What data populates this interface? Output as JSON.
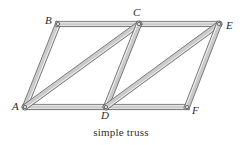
{
  "figure": {
    "caption": "simple truss",
    "background_color": "#ffffff",
    "label_color": "#2b2b2b",
    "member_fill_light": "#e9e9e9",
    "member_fill_mid": "#cfcfcf",
    "member_fill_dark": "#a9a9a9",
    "member_outline": "#58585a",
    "joint_pin_fill": "#d8d8d8",
    "joint_pin_stroke": "#4a4a4a",
    "member_width": 5.2
  },
  "truss": {
    "type": "planar-simple-truss",
    "joint_count": 6,
    "member_count": 9,
    "joints": [
      {
        "id": "A",
        "label": "A",
        "x": 25,
        "y": 107,
        "label_x": 12,
        "label_y": 101
      },
      {
        "id": "B",
        "label": "B",
        "x": 58,
        "y": 24,
        "label_x": 45,
        "label_y": 15
      },
      {
        "id": "C",
        "label": "C",
        "x": 139,
        "y": 24,
        "label_x": 133,
        "label_y": 7
      },
      {
        "id": "D",
        "label": "D",
        "x": 106,
        "y": 107,
        "label_x": 101,
        "label_y": 110
      },
      {
        "id": "E",
        "label": "E",
        "x": 219,
        "y": 24,
        "label_x": 226,
        "label_y": 20
      },
      {
        "id": "F",
        "label": "F",
        "x": 187,
        "y": 107,
        "label_x": 192,
        "label_y": 105
      }
    ],
    "members": [
      {
        "id": "AB",
        "from": "A",
        "to": "B",
        "chord": "left-end-post"
      },
      {
        "id": "BC",
        "from": "B",
        "to": "C",
        "chord": "top"
      },
      {
        "id": "CE",
        "from": "C",
        "to": "E",
        "chord": "top"
      },
      {
        "id": "AD",
        "from": "A",
        "to": "D",
        "chord": "bottom"
      },
      {
        "id": "DF",
        "from": "D",
        "to": "F",
        "chord": "bottom"
      },
      {
        "id": "AC",
        "from": "A",
        "to": "C",
        "chord": "diagonal"
      },
      {
        "id": "CD",
        "from": "C",
        "to": "D",
        "chord": "diagonal"
      },
      {
        "id": "DE",
        "from": "D",
        "to": "E",
        "chord": "diagonal"
      },
      {
        "id": "EF",
        "from": "E",
        "to": "F",
        "chord": "right-end-post"
      }
    ]
  }
}
